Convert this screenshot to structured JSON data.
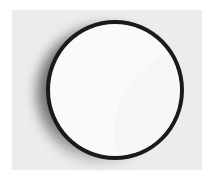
{
  "image": {
    "subject": "fingerprint-disc",
    "colors": {
      "background": "#ececec",
      "ring": "#1a1a1a",
      "disc": "#fafafa",
      "ridges": "#333333"
    }
  }
}
